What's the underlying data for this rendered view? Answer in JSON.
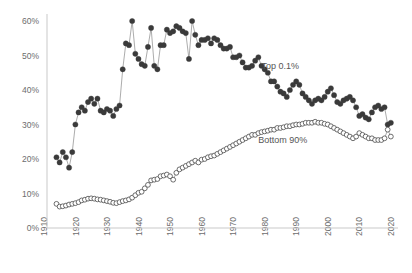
{
  "chart_data": {
    "type": "scatter",
    "title": "",
    "subtitle": "",
    "xlabel": "",
    "ylabel": "",
    "xlim": [
      1910,
      2020
    ],
    "ylim": [
      0,
      0.6
    ],
    "grid": false,
    "legend_position": "inline-annotation",
    "y_tick_labels": [
      "0%",
      "10%",
      "20%",
      "30%",
      "40%",
      "50%",
      "60%"
    ],
    "y_tick_values": [
      0,
      10,
      20,
      30,
      40,
      50,
      60
    ],
    "x_tick_labels": [
      "1910",
      "1920",
      "1930",
      "1940",
      "1950",
      "1960",
      "1970",
      "1980",
      "1990",
      "2000",
      "2010",
      "2020"
    ],
    "x_tick_values": [
      1910,
      1920,
      1930,
      1940,
      1950,
      1960,
      1970,
      1980,
      1990,
      2000,
      2010,
      2020
    ],
    "annotations": [
      {
        "text": "Top 0.1%",
        "x": 1978,
        "y": 46.0
      },
      {
        "text": "Bottom 90%",
        "x": 1977,
        "y": 24.5
      }
    ],
    "series": [
      {
        "name": "Top 0.1%",
        "marker": "filled-circle",
        "color": "#3a3a3a",
        "x": [
          1913,
          1914,
          1915,
          1916,
          1917,
          1918,
          1919,
          1920,
          1921,
          1922,
          1923,
          1924,
          1925,
          1926,
          1927,
          1928,
          1929,
          1930,
          1931,
          1932,
          1933,
          1934,
          1935,
          1936,
          1937,
          1938,
          1939,
          1940,
          1941,
          1942,
          1943,
          1944,
          1945,
          1946,
          1947,
          1948,
          1949,
          1950,
          1951,
          1952,
          1953,
          1954,
          1955,
          1956,
          1957,
          1958,
          1959,
          1960,
          1961,
          1962,
          1963,
          1964,
          1965,
          1966,
          1967,
          1968,
          1969,
          1970,
          1971,
          1972,
          1973,
          1974,
          1975,
          1976,
          1977,
          1978,
          1979,
          1980,
          1981,
          1982,
          1983,
          1984,
          1985,
          1986,
          1987,
          1988,
          1989,
          1990,
          1991,
          1992,
          1993,
          1994,
          1995,
          1996,
          1997,
          1998,
          1999,
          2000,
          2001,
          2002,
          2003,
          2004,
          2005,
          2006,
          2007,
          2008,
          2009,
          2010,
          2011,
          2012,
          2013,
          2014,
          2015,
          2016,
          2017,
          2018,
          2019
        ],
        "values": [
          20.5,
          19.0,
          22.0,
          20.5,
          17.5,
          22.0,
          30.0,
          33.5,
          35.0,
          34.0,
          36.5,
          37.5,
          36.0,
          37.5,
          34.0,
          33.5,
          34.5,
          34.0,
          32.5,
          34.5,
          35.5,
          46.0,
          53.5,
          53.0,
          60.0,
          50.5,
          49.0,
          47.5,
          47.0,
          52.5,
          58.0,
          47.0,
          46.0,
          53.0,
          53.0,
          57.5,
          56.5,
          57.0,
          58.5,
          58.0,
          57.0,
          56.5,
          49.0,
          60.0,
          56.0,
          53.0,
          54.5,
          54.5,
          55.0,
          53.5,
          55.0,
          54.5,
          53.0,
          52.0,
          52.0,
          52.5,
          49.5,
          49.5,
          50.0,
          48.0,
          46.5,
          46.5,
          47.0,
          48.5,
          49.5,
          47.0,
          46.0,
          45.0,
          42.5,
          42.5,
          41.0,
          39.5,
          39.0,
          38.0,
          40.0,
          41.5,
          42.5,
          41.5,
          39.0,
          38.0,
          37.0,
          36.0,
          37.0,
          37.5,
          37.0,
          38.0,
          39.5,
          40.5,
          38.5,
          36.5,
          36.0,
          37.0,
          37.5,
          38.0,
          37.0,
          35.0,
          32.5,
          33.0,
          32.0,
          31.5,
          33.5,
          35.0,
          35.5,
          34.5,
          35.0,
          30.0,
          30.5
        ]
      },
      {
        "name": "Bottom 90%",
        "marker": "open-circle",
        "color": "#ffffff",
        "x": [
          1913,
          1914,
          1915,
          1916,
          1917,
          1918,
          1919,
          1920,
          1921,
          1922,
          1923,
          1924,
          1925,
          1926,
          1927,
          1928,
          1929,
          1930,
          1931,
          1932,
          1933,
          1934,
          1935,
          1936,
          1937,
          1938,
          1939,
          1940,
          1941,
          1942,
          1943,
          1944,
          1945,
          1946,
          1947,
          1948,
          1949,
          1950,
          1951,
          1952,
          1953,
          1954,
          1955,
          1956,
          1957,
          1958,
          1959,
          1960,
          1961,
          1962,
          1963,
          1964,
          1965,
          1966,
          1967,
          1968,
          1969,
          1970,
          1971,
          1972,
          1973,
          1974,
          1975,
          1976,
          1977,
          1978,
          1979,
          1980,
          1981,
          1982,
          1983,
          1984,
          1985,
          1986,
          1987,
          1988,
          1989,
          1990,
          1991,
          1992,
          1993,
          1994,
          1995,
          1996,
          1997,
          1998,
          1999,
          2000,
          2001,
          2002,
          2003,
          2004,
          2005,
          2006,
          2007,
          2008,
          2009,
          2010,
          2011,
          2012,
          2013,
          2014,
          2015,
          2016,
          2017,
          2018,
          2019
        ],
        "values": [
          7.0,
          6.2,
          6.3,
          6.5,
          6.8,
          7.0,
          7.2,
          7.5,
          8.0,
          8.2,
          8.5,
          8.6,
          8.5,
          8.3,
          8.2,
          8.0,
          7.8,
          7.6,
          7.3,
          7.2,
          7.5,
          7.8,
          8.0,
          8.3,
          8.8,
          9.5,
          10.2,
          10.5,
          11.5,
          12.5,
          13.8,
          14.0,
          14.2,
          15.0,
          15.2,
          15.5,
          15.0,
          14.0,
          16.0,
          17.0,
          17.5,
          18.0,
          18.5,
          19.0,
          19.5,
          19.0,
          19.8,
          20.0,
          20.5,
          20.8,
          21.0,
          21.5,
          22.0,
          22.5,
          23.0,
          23.5,
          24.0,
          24.5,
          25.0,
          25.5,
          26.0,
          26.5,
          27.0,
          27.0,
          27.5,
          27.8,
          28.0,
          28.2,
          28.5,
          28.5,
          29.0,
          29.0,
          29.2,
          29.5,
          29.5,
          29.8,
          30.0,
          30.0,
          30.2,
          30.5,
          30.5,
          30.5,
          30.8,
          30.5,
          30.5,
          30.2,
          30.0,
          29.5,
          29.0,
          28.5,
          28.0,
          27.5,
          27.0,
          26.5,
          26.0,
          26.5,
          27.5,
          27.0,
          26.5,
          26.0,
          26.0,
          25.5,
          25.5,
          25.5,
          26.0,
          28.5,
          26.5
        ]
      }
    ]
  }
}
